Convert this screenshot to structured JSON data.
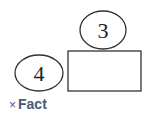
{
  "diagram": {
    "top_ellipse": {
      "label": "3"
    },
    "left_ellipse": {
      "label": "4"
    },
    "box": {
      "label": ""
    }
  },
  "tag": {
    "remove_symbol": "×",
    "label": "Fact",
    "color": "#4a5a78"
  }
}
